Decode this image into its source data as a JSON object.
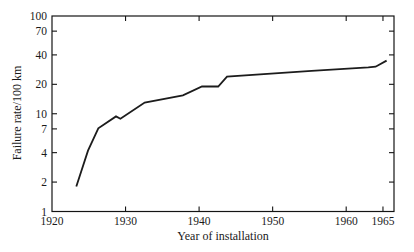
{
  "figure": {
    "background": "#ffffff",
    "line_color": "#1c1c1c",
    "axis_color": "#141414",
    "text_color": "#1a1a1a"
  },
  "chart_data": {
    "type": "line",
    "title": "",
    "xlabel": "Year of installation",
    "ylabel": "Failure rate/100 km",
    "x_scale": "linear",
    "y_scale": "log",
    "xlim": [
      1920,
      1966.5
    ],
    "ylim": [
      1,
      100
    ],
    "grid": false,
    "legend": "none",
    "x_tick_labels": [
      1920,
      1930,
      1940,
      1950,
      1960,
      1965
    ],
    "x_tick_marks": [
      1930,
      1940,
      1950,
      1960,
      1965
    ],
    "y_tick_labels": [
      1,
      2,
      4,
      7,
      10,
      20,
      40,
      70,
      100
    ],
    "y_tick_marks_right": [
      2,
      4,
      7,
      10,
      20,
      40,
      70
    ],
    "series": [
      {
        "name": "failure-rate-vs-installation-year",
        "points": [
          [
            1923.3,
            1.8
          ],
          [
            1924.9,
            4.2
          ],
          [
            1926.3,
            7.1
          ],
          [
            1928.7,
            9.4
          ],
          [
            1929.3,
            8.9
          ],
          [
            1932.6,
            13.0
          ],
          [
            1937.8,
            15.4
          ],
          [
            1940.4,
            19.0
          ],
          [
            1942.6,
            19.0
          ],
          [
            1943.8,
            24.0
          ],
          [
            1955.3,
            27.5
          ],
          [
            1963.0,
            29.8
          ],
          [
            1964.0,
            30.3
          ],
          [
            1965.5,
            35.0
          ]
        ]
      }
    ]
  }
}
